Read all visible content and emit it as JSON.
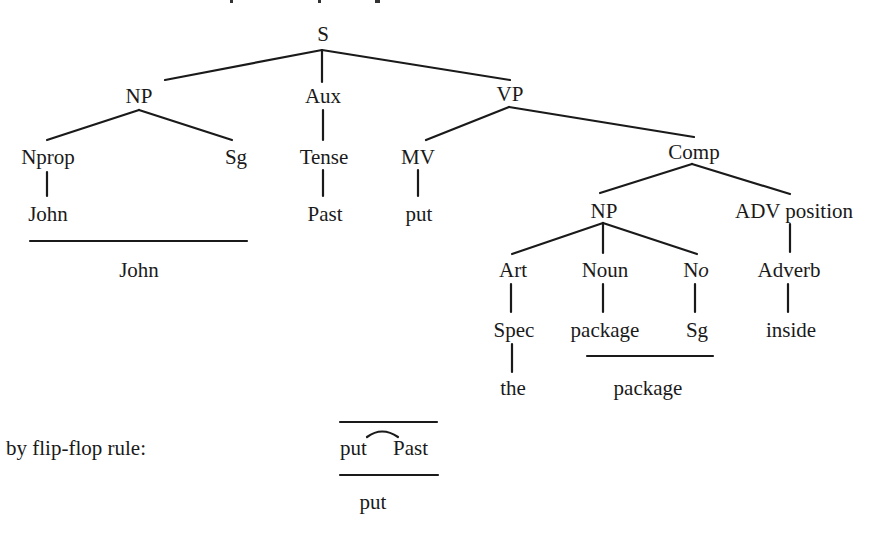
{
  "diagram": {
    "type": "phrase-structure-tree",
    "root": {
      "label": "S",
      "children": [
        {
          "label": "NP",
          "children": [
            {
              "label": "Nprop",
              "children": [
                {
                  "label": "John"
                }
              ]
            },
            {
              "label": "Sg"
            }
          ]
        },
        {
          "label": "Aux",
          "children": [
            {
              "label": "Tense",
              "children": [
                {
                  "label": "Past"
                }
              ]
            }
          ]
        },
        {
          "label": "VP",
          "children": [
            {
              "label": "MV",
              "children": [
                {
                  "label": "put"
                }
              ]
            },
            {
              "label": "Comp",
              "children": [
                {
                  "label": "NP",
                  "children": [
                    {
                      "label": "Art",
                      "children": [
                        {
                          "label": "Spec",
                          "children": [
                            {
                              "label": "the"
                            }
                          ]
                        }
                      ]
                    },
                    {
                      "label": "Noun",
                      "children": [
                        {
                          "label": "package"
                        }
                      ]
                    },
                    {
                      "label": "No",
                      "children": [
                        {
                          "label": "Sg"
                        }
                      ]
                    }
                  ]
                },
                {
                  "label": "ADV position",
                  "children": [
                    {
                      "label": "Adverb",
                      "children": [
                        {
                          "label": "inside"
                        }
                      ]
                    }
                  ]
                }
              ]
            }
          ]
        }
      ]
    }
  },
  "labels": {
    "s": "S",
    "np": "NP",
    "aux": "Aux",
    "vp": "VP",
    "nprop": "Nprop",
    "sg1": "Sg",
    "tense": "Tense",
    "mv": "MV",
    "comp": "Comp",
    "john1": "John",
    "past": "Past",
    "put1": "put",
    "john2": "John",
    "np2": "NP",
    "advpos": "ADV position",
    "art": "Art",
    "noun": "Noun",
    "no_n": "N",
    "no_o": "o",
    "adverb": "Adverb",
    "spec": "Spec",
    "package1": "package",
    "sg2": "Sg",
    "inside": "inside",
    "the": "the",
    "package2": "package"
  },
  "rule": {
    "caption": "by flip-flop rule:",
    "input_left": "put",
    "input_right": "Past",
    "output": "put"
  }
}
